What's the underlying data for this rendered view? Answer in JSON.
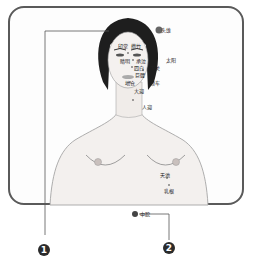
{
  "diagram": {
    "type": "acupoint-chart",
    "colors": {
      "frame": "#5a5a5a",
      "skin": "#f3f0ee",
      "hair": "#1e1e1e",
      "marker": "#444444",
      "badge": "#2b2b2b"
    },
    "face_points": [
      {
        "id": "touwei",
        "label": "头维"
      },
      {
        "id": "yintang",
        "label": "印堂"
      },
      {
        "id": "cuanzhu",
        "label": "攒竹"
      },
      {
        "id": "jingming",
        "label": "睛明"
      },
      {
        "id": "chengqi",
        "label": "承泣"
      },
      {
        "id": "sibai",
        "label": "四白"
      },
      {
        "id": "xiaguan",
        "label": "下关"
      },
      {
        "id": "juliao",
        "label": "巨髎"
      },
      {
        "id": "jiache",
        "label": "颊车"
      },
      {
        "id": "dicang",
        "label": "地仓"
      },
      {
        "id": "daying",
        "label": "大迎"
      },
      {
        "id": "taiyang",
        "label": "太阳"
      },
      {
        "id": "renying",
        "label": "人迎"
      }
    ],
    "chest_points": [
      {
        "id": "tianchi",
        "label": "天池"
      },
      {
        "id": "rugen",
        "label": "乳根"
      },
      {
        "id": "zhongwan",
        "label": "中脘"
      }
    ],
    "callouts": [
      {
        "number": "1",
        "target": "touwei"
      },
      {
        "number": "2",
        "target": "zhongwan"
      }
    ]
  }
}
